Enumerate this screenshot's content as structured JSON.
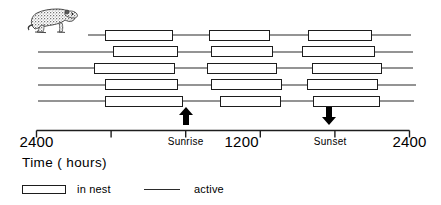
{
  "figure": {
    "axis_title": "Time  ( hours)",
    "animal_icon": "marmot-illustration"
  },
  "legend": {
    "items": [
      {
        "swatch": "box",
        "label": "in nest"
      },
      {
        "swatch": "line",
        "label": "active"
      }
    ]
  },
  "annotations": [
    {
      "name": "sunrise-arrow",
      "icon": "arrow-up-icon",
      "direction": "up",
      "x_hours": 9.6
    },
    {
      "name": "sunset-arrow",
      "icon": "arrow-down-icon",
      "direction": "down",
      "x_hours": 18.8
    }
  ],
  "chart_data": {
    "type": "bar",
    "title": "",
    "subtitle": "",
    "xlabel": "Time  ( hours)",
    "ylabel": "",
    "grid": false,
    "legend_position": "bottom-left",
    "x_axis": {
      "range_hours": [
        0,
        24
      ],
      "tick_hours": [
        0,
        4.8,
        9.6,
        14.4,
        19.2,
        24
      ],
      "tick_labels": [
        "2400",
        "",
        "Sunrise",
        "1200",
        "Sunset",
        "2400"
      ],
      "major_labels": [
        {
          "label": "2400",
          "hours": 0,
          "style": "big"
        },
        {
          "label": "Sunrise",
          "hours": 9.6,
          "style": "small"
        },
        {
          "label": "1200",
          "hours": 13.2,
          "style": "big"
        },
        {
          "label": "Sunset",
          "hours": 18.9,
          "style": "small"
        },
        {
          "label": "2400",
          "hours": 24,
          "style": "big"
        }
      ]
    },
    "series": [
      {
        "name": "in nest",
        "style": "open-box"
      },
      {
        "name": "active",
        "style": "line"
      }
    ],
    "rows": [
      {
        "row": 1,
        "line_start_hours": 3.3,
        "line_end_hours": 24.1,
        "nest_intervals": [
          [
            4.4,
            8.8
          ],
          [
            11.1,
            15.0
          ],
          [
            17.5,
            21.6
          ]
        ]
      },
      {
        "row": 2,
        "line_start_hours": 0.1,
        "line_end_hours": 24.2,
        "nest_intervals": [
          [
            4.9,
            9.1
          ],
          [
            11.2,
            15.2
          ],
          [
            17.1,
            21.8
          ]
        ]
      },
      {
        "row": 3,
        "line_start_hours": 0.1,
        "line_end_hours": 24.2,
        "nest_intervals": [
          [
            3.7,
            8.9
          ],
          [
            11.0,
            15.5
          ],
          [
            17.7,
            22.2
          ]
        ]
      },
      {
        "row": 4,
        "line_start_hours": 0.1,
        "line_end_hours": 24.4,
        "nest_intervals": [
          [
            4.4,
            9.1
          ],
          [
            11.2,
            15.8
          ],
          [
            17.4,
            22.0
          ]
        ]
      },
      {
        "row": 5,
        "line_start_hours": 0.1,
        "line_end_hours": 24.3,
        "nest_intervals": [
          [
            4.4,
            9.4
          ],
          [
            11.8,
            15.7
          ],
          [
            17.8,
            22.1
          ]
        ]
      }
    ]
  }
}
